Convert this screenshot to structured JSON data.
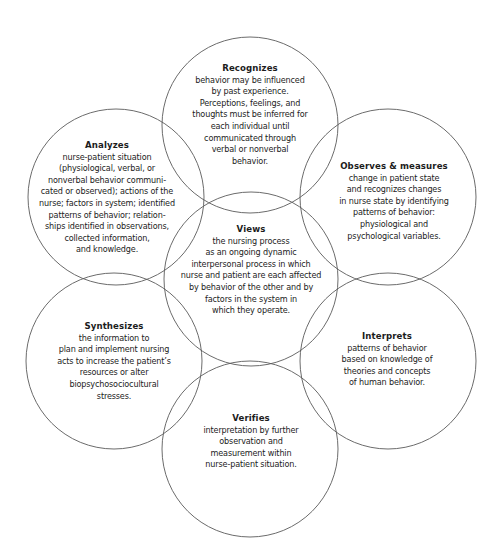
{
  "diagram": {
    "type": "overlapping-circles",
    "stroke_color": "#5a5a5a",
    "text_color": "#1c1c1c",
    "background": "#ffffff",
    "center": {
      "title": "Views",
      "lines": [
        "the nursing process",
        "as an ongoing dynamic",
        "interpersonal process in which",
        "nurse and patient are each affected",
        "by behavior of the other and by",
        "factors in the system in",
        "which they operate."
      ]
    },
    "nodes": [
      {
        "id": "recognizes",
        "title": "Recognizes",
        "lines": [
          "behavior may be influenced",
          "by past experience.",
          "Perceptions, feelings, and",
          "thoughts must be inferred for",
          "each individual until",
          "communicated through",
          "verbal or nonverbal",
          "behavior."
        ]
      },
      {
        "id": "observes-measures",
        "title": "Observes & measures",
        "lines": [
          "change in patient state",
          "and recognizes changes",
          "in nurse state by identifying",
          "patterns of behavior:",
          "physiological and",
          "psychological variables."
        ]
      },
      {
        "id": "interprets",
        "title": "Interprets",
        "lines": [
          "patterns of behavior",
          "based on knowledge of",
          "theories and concepts",
          "of human behavior."
        ]
      },
      {
        "id": "verifies",
        "title": "Verifies",
        "lines": [
          "interpretation by further",
          "observation and",
          "measurement within",
          "nurse-patient situation."
        ]
      },
      {
        "id": "synthesizes",
        "title": "Synthesizes",
        "lines": [
          "the information to",
          "plan and implement nursing",
          "acts to increase the patient’s",
          "resources or alter",
          "biopsychosociocultural",
          "stresses."
        ]
      },
      {
        "id": "analyzes",
        "title": "Analyzes",
        "lines": [
          "nurse-patient situation",
          "(physiological, verbal, or",
          "nonverbal behavior communi-",
          "cated or observed); actions of the",
          "nurse; factors in system; identified",
          "patterns of behavior; relation-",
          "ships identified in observations,",
          "collected information,",
          "and knowledge."
        ]
      }
    ]
  }
}
